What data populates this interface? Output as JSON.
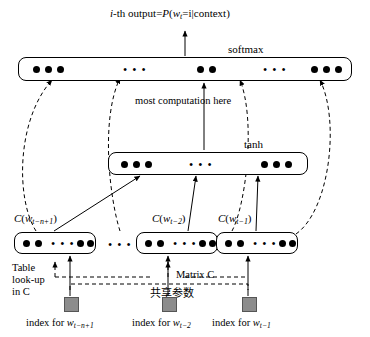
{
  "figure": {
    "title_parts": {
      "prefix": "i",
      "dash_output": "-th output=",
      "prob": "P",
      "paren_open": "(",
      "w": "w",
      "w_sub": "t",
      "equals_i": "=i",
      "bar_context": "|context",
      "paren_close": ")"
    },
    "labels": {
      "softmax": "softmax",
      "tanh": "tanh",
      "most_computation": "most computation here",
      "table_lookup_line1": "Table",
      "table_lookup_line2": "look-up",
      "table_lookup_line3": "in C",
      "matrix_c": "Matrix C",
      "shared_params_cjk": "共享参数"
    },
    "embedding_boxes": [
      {
        "name": "C",
        "paren_open": "(",
        "w": "w",
        "sub": "t−n+1",
        "paren_close": ")"
      },
      {
        "name": "C",
        "paren_open": "(",
        "w": "w",
        "sub": "t−2",
        "paren_close": ")"
      },
      {
        "name": "C",
        "paren_open": "(",
        "w": "w",
        "sub": "t−1",
        "paren_close": ")"
      }
    ],
    "index_labels": [
      {
        "prefix": "index for ",
        "w": "w",
        "sub": "t−n+1"
      },
      {
        "prefix": "index for ",
        "w": "w",
        "sub": "t−2"
      },
      {
        "prefix": "index for ",
        "w": "w",
        "sub": "t−1"
      }
    ],
    "ellipses": "• • •",
    "colors": {
      "ink": "#000000",
      "square_fill": "#8c8c8c",
      "background": "#ffffff"
    }
  }
}
